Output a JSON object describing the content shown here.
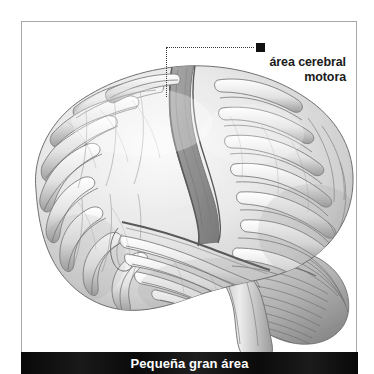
{
  "figure": {
    "title": "Pequeña gran área"
  },
  "callout": {
    "bullet": "filled-square-marker",
    "line1": "área cerebral",
    "line2": "motora"
  },
  "caption": {
    "text": "Pequeña gran área"
  },
  "colors": {
    "frame_border": "#a9a9a9",
    "caption_bar": "#000000",
    "caption_text": "#ffffff",
    "label_text": "#1a1a1a",
    "bullet": "#111111",
    "leader_line": "#3a3a3a",
    "motor_strip": "#8f8f8f",
    "brain_light": "#f2f2f2",
    "brain_mid": "#c8c8c8",
    "brain_dark": "#8a8a8a"
  }
}
